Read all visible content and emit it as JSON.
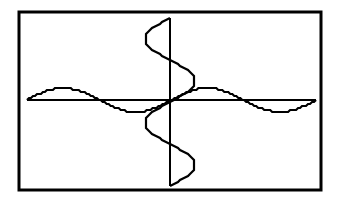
{
  "chart_data": {
    "type": "line",
    "title": "",
    "xlabel": "",
    "ylabel": "",
    "grid": false,
    "legend": null,
    "colors": {
      "background": "#ffffff",
      "ink": "#000000"
    },
    "frame": {
      "left": 19,
      "top": 12,
      "right": 321,
      "bottom": 190,
      "stroke_width": 3
    },
    "axes": {
      "x_axis": {
        "y": 100,
        "from": 27,
        "to": 316
      },
      "y_axis": {
        "x": 170,
        "from": 18,
        "to": 186
      }
    },
    "series": [
      {
        "name": "horizontal-sine",
        "orientation": "horizontal",
        "description": "y = sin(x) along x-axis, two periods",
        "start": 27,
        "end": 316,
        "periods": 2,
        "amplitude_px": 12,
        "phase": "rises above axis first"
      },
      {
        "name": "vertical-sine",
        "orientation": "vertical",
        "description": "x = sin(y) along y-axis, two periods",
        "start": 18,
        "end": 186,
        "periods": 2,
        "amplitude_px": 25,
        "phase": "bulges left first at top"
      }
    ]
  }
}
